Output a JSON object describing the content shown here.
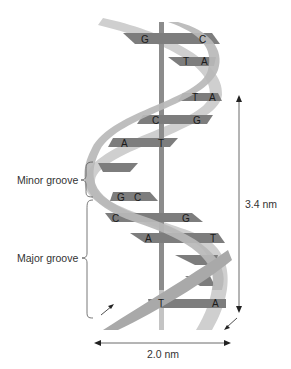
{
  "diagram": {
    "labels": {
      "minor_groove": "Minor groove",
      "major_groove": "Major groove",
      "pitch": "3.4 nm",
      "diameter": "2.0 nm"
    },
    "base_pairs": [
      {
        "left": "G",
        "right": "C"
      },
      {
        "left": "T",
        "right": "A"
      },
      {
        "left": "T",
        "right": "A"
      },
      {
        "left": "C",
        "right": "G"
      },
      {
        "left": "A",
        "right": "T"
      },
      {
        "left": "",
        "right": ""
      },
      {
        "left": "G",
        "right": "C"
      },
      {
        "left": "C",
        "right": "G"
      },
      {
        "left": "A",
        "right": "T"
      },
      {
        "left": "",
        "right": ""
      },
      {
        "left": "",
        "right": ""
      },
      {
        "left": "T",
        "right": "A"
      }
    ],
    "colors": {
      "base_pair": "#7d7d7d",
      "axis": "#8c8c8c",
      "strand_light": "#cfcfcf",
      "strand_mid": "#b0b0b0",
      "text": "#333333"
    }
  }
}
